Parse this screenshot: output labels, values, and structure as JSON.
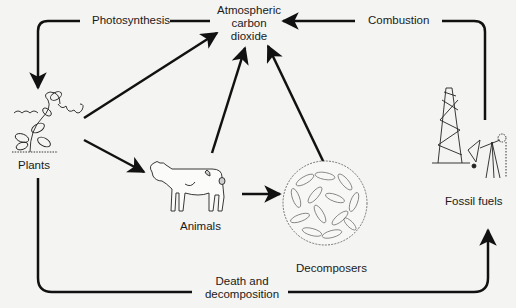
{
  "diagram": {
    "nodes": {
      "atmosphere": {
        "line1": "Atmospheric",
        "line2": "carbon",
        "line3": "dioxide"
      },
      "plants": {
        "label": "Plants"
      },
      "animals": {
        "label": "Animals"
      },
      "decomposers": {
        "label": "Decomposers"
      },
      "fossil_fuels": {
        "label": "Fossil fuels"
      }
    },
    "processes": {
      "photosynthesis": "Photosynthesis",
      "combustion": "Combustion",
      "death_line1": "Death and",
      "death_line2": "decomposition"
    },
    "edges": [
      {
        "from": "atmosphere",
        "to": "plants",
        "label": "Photosynthesis"
      },
      {
        "from": "fossil_fuels",
        "to": "atmosphere",
        "label": "Combustion"
      },
      {
        "from": "plants",
        "to": "atmosphere"
      },
      {
        "from": "plants",
        "to": "animals"
      },
      {
        "from": "animals",
        "to": "atmosphere"
      },
      {
        "from": "animals",
        "to": "decomposers"
      },
      {
        "from": "decomposers",
        "to": "atmosphere"
      },
      {
        "from": "plants",
        "to": "fossil_fuels",
        "label": "Death and decomposition"
      }
    ],
    "colors": {
      "line": "#111111",
      "background": "#f4f4f2"
    }
  }
}
